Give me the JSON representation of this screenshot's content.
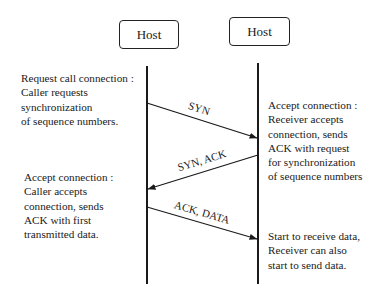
{
  "hosts": [
    {
      "label": "Host"
    },
    {
      "label": "Host"
    }
  ],
  "notes": {
    "left_top": "Request call connection :\nCaller requests\nsynchronization\nof sequence numbers.",
    "right_top": "Accept connection :\nReceiver accepts\nconnection, sends\nACK with request\nfor synchronization\nof sequence numbers",
    "left_bottom": "Accept connection :\nCaller accepts\nconnection, sends\nACK with first\ntransmitted data.",
    "right_bottom": "Start to receive data,\nReceiver can also\nstart to send data."
  },
  "messages": [
    {
      "label": "SYN",
      "direction": "left-to-right"
    },
    {
      "label": "SYN, ACK",
      "direction": "right-to-left"
    },
    {
      "label": "ACK, DATA",
      "direction": "left-to-right"
    }
  ],
  "colors": {
    "line": "#1a1a1a",
    "background": "#ffffff"
  }
}
